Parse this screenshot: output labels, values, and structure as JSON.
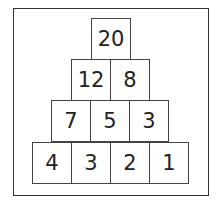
{
  "pyramid": {
    "rows": [
      [
        "20"
      ],
      [
        "12",
        "8"
      ],
      [
        "7",
        "5",
        "3"
      ],
      [
        "4",
        "3",
        "2",
        "1"
      ]
    ]
  }
}
